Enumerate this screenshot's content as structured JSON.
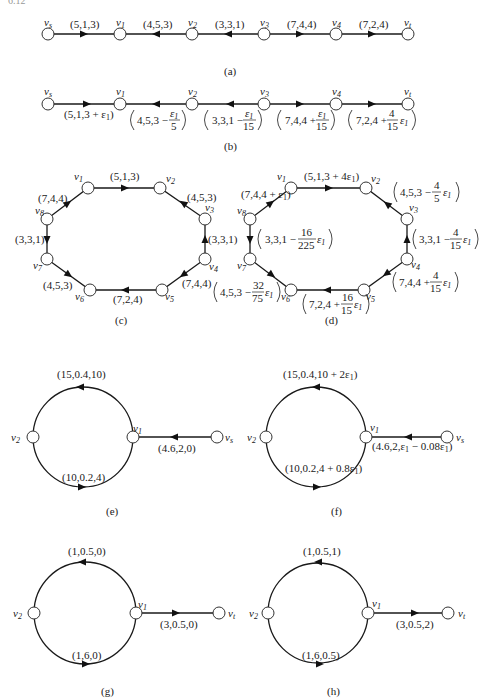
{
  "corner_label": "6.12",
  "figures": {
    "a": {
      "caption": "(a)",
      "nodes": [
        "vs",
        "v1",
        "v2",
        "v3",
        "v4",
        "vt"
      ],
      "edges": [
        {
          "from": "vs",
          "to": "v1",
          "label": "(5,1,3)"
        },
        {
          "from": "v2",
          "to": "v1",
          "label": "(4,5,3)"
        },
        {
          "from": "v3",
          "to": "v2",
          "label": "(3,3,1)"
        },
        {
          "from": "v3",
          "to": "v4",
          "label": "(7,4,4)"
        },
        {
          "from": "v4",
          "to": "vt",
          "label": "(7,2,4)"
        }
      ]
    },
    "b": {
      "caption": "(b)",
      "nodes": [
        "vs",
        "v1",
        "v2",
        "v3",
        "v4",
        "vt"
      ],
      "edges": [
        {
          "from": "vs",
          "to": "v1",
          "label": "(5,1,3 + ε1)"
        },
        {
          "from": "v2",
          "to": "v1",
          "label": "(4,5,3 − ε1/5)"
        },
        {
          "from": "v3",
          "to": "v2",
          "label": "(3,3,1 − ε1/15)"
        },
        {
          "from": "v3",
          "to": "v4",
          "label": "(7,4,4 + ε1/15)"
        },
        {
          "from": "v4",
          "to": "vt",
          "label": "(7,2,4 + 4/15 ε1)"
        }
      ]
    },
    "c": {
      "caption": "(c)",
      "nodes": [
        "v1",
        "v2",
        "v3",
        "v4",
        "v5",
        "v6",
        "v7",
        "v8"
      ],
      "edges": [
        {
          "from": "v1",
          "to": "v2",
          "label": "(5,1,3)"
        },
        {
          "from": "v3",
          "to": "v2",
          "label": "(4,5,3)"
        },
        {
          "from": "v4",
          "to": "v3",
          "label": "(3,3,1)"
        },
        {
          "from": "v4",
          "to": "v5",
          "label": "(7,4,4)"
        },
        {
          "from": "v5",
          "to": "v6",
          "label": "(7,2,4)"
        },
        {
          "from": "v7",
          "to": "v6",
          "label": "(4,5,3)"
        },
        {
          "from": "v8",
          "to": "v7",
          "label": "(3,3,1)"
        },
        {
          "from": "v8",
          "to": "v1",
          "label": "(7,4,4)"
        }
      ]
    },
    "d": {
      "caption": "(d)",
      "nodes": [
        "v1",
        "v2",
        "v3",
        "v4",
        "v5",
        "v6",
        "v7",
        "v8"
      ],
      "edges": [
        {
          "from": "v1",
          "to": "v2",
          "label": "(5,1,3 + 4ε1)"
        },
        {
          "from": "v3",
          "to": "v2",
          "label": "(4,5,3 − 4/5 ε1)"
        },
        {
          "from": "v4",
          "to": "v3",
          "label": "(3,3,1 − 4/15 ε1)"
        },
        {
          "from": "v4",
          "to": "v5",
          "label": "(7,4,4 + 4/15 ε1)"
        },
        {
          "from": "v5",
          "to": "v6",
          "label": "(7,2,4 + 16/15 ε1)"
        },
        {
          "from": "v7",
          "to": "v6",
          "label": "(4,5,3 − 32/75 ε1)"
        },
        {
          "from": "v8",
          "to": "v7",
          "label": "(3,3,1 − 16/225 ε1)"
        },
        {
          "from": "v8",
          "to": "v1",
          "label": "(7,4,4 + ε1)"
        }
      ]
    },
    "e": {
      "caption": "(e)",
      "nodes": [
        "v2",
        "v1",
        "vs"
      ],
      "edges": [
        {
          "from": "v1",
          "to": "v2",
          "via": "top",
          "label": "(15,0.4,10)"
        },
        {
          "from": "v2",
          "to": "v1",
          "via": "bottom",
          "label": "(10,0.2,4)"
        },
        {
          "from": "vs",
          "to": "v1",
          "label": "(4.6,2,0)"
        }
      ]
    },
    "f": {
      "caption": "(f)",
      "nodes": [
        "v2",
        "v1",
        "vs"
      ],
      "edges": [
        {
          "from": "v1",
          "to": "v2",
          "via": "top",
          "label": "(15,0.4,10 + 2ε1)"
        },
        {
          "from": "v2",
          "to": "v1",
          "via": "bottom",
          "label": "(10,0.2,4 + 0.8ε1)"
        },
        {
          "from": "vs",
          "to": "v1",
          "label": "(4.6,2,ε1 − 0.08ε1)"
        }
      ]
    },
    "g": {
      "caption": "(g)",
      "nodes": [
        "v2",
        "v1",
        "vt"
      ],
      "edges": [
        {
          "from": "v1",
          "to": "v2",
          "via": "top",
          "label": "(1,0.5,0)"
        },
        {
          "from": "v2",
          "to": "v1",
          "via": "bottom",
          "label": "(1,6,0)"
        },
        {
          "from": "v1",
          "to": "vt",
          "label": "(3,0.5,0)"
        }
      ]
    },
    "h": {
      "caption": "(h)",
      "nodes": [
        "v2",
        "v1",
        "vt"
      ],
      "edges": [
        {
          "from": "v1",
          "to": "v2",
          "via": "top",
          "label": "(1,0.5,1)"
        },
        {
          "from": "v2",
          "to": "v1",
          "via": "bottom",
          "label": "(1,6,0.5)"
        },
        {
          "from": "v1",
          "to": "vt",
          "label": "(3,0.5,2)"
        }
      ]
    }
  },
  "text": {
    "a_e1": "(5,1,3)",
    "a_e2": "(4,5,3)",
    "a_e3": "(3,3,1)",
    "a_e4": "(7,4,4)",
    "a_e5": "(7,2,4)",
    "b_e1": "(5,1,3 + ε",
    "b_e2a": "4,5,3 −",
    "b_e3a": "3,3,1 −",
    "b_e4a": "7,4,4 +",
    "b_e5a": "7,2,4 +",
    "eps": "ε",
    "one": "1",
    "five": "5",
    "fifteen": "15",
    "four": "4",
    "sixteen": "16",
    "two25": "225",
    "thirty2": "32",
    "seventy5": "75",
    "c_e1": "(5,1,3)",
    "c_e2": "(4,5,3)",
    "c_e3": "(3,3,1)",
    "c_e4": "(7,4,4)",
    "c_e5": "(7,2,4)",
    "c_e6": "(4,5,3)",
    "c_e7": "(3,3,1)",
    "c_e8": "(7,4,4)",
    "d_e1": "(5,1,3 + 4ε",
    "d_e8": "(7,4,4 + ε",
    "d_e2a": "4,5,3 −",
    "d_e3a": "3,3,1 −",
    "d_e4a": "7,4,4 +",
    "d_e5a": "7,2,4 +",
    "d_e6a": "4,5,3 −",
    "d_e7a": "3,3,1 −",
    "e_top": "(15,0.4,10)",
    "e_bot": "(10,0.2,4)",
    "e_in": "(4.6,2,0)",
    "f_top": "(15,0.4,10 + 2ε",
    "f_bot": "(10,0.2,4 + 0.8ε",
    "f_in": "(4.6,2,ε",
    "f_in2": " − 0.08ε",
    "g_top": "(1,0.5,0)",
    "g_bot": "(1,6,0)",
    "g_out": "(3,0.5,0)",
    "h_top": "(1,0.5,1)",
    "h_bot": "(1,6,0.5)",
    "h_out": "(3,0.5,2)",
    "v": "v",
    "s": "s",
    "t": "t",
    "n1": "1",
    "n2": "2",
    "n3": "3",
    "n4": "4",
    "n5": "5",
    "n6": "6",
    "n7": "7",
    "n8": "8",
    "close": ")",
    "cap_a": "(a)",
    "cap_b": "(b)",
    "cap_c": "(c)",
    "cap_d": "(d)",
    "cap_e": "(e)",
    "cap_f": "(f)",
    "cap_g": "(g)",
    "cap_h": "(h)"
  }
}
